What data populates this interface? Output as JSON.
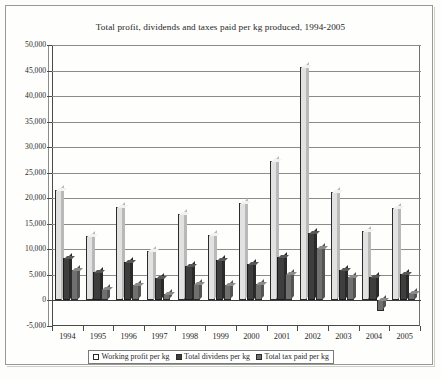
{
  "chart_data": {
    "type": "bar",
    "title": "Total profit, dividends and taxes paid per kg produced, 1994-2005",
    "xlabel": "",
    "ylabel": "",
    "ylim": [
      -5000,
      50000
    ],
    "ytick_step": 5000,
    "grid": true,
    "legend_position": "bottom",
    "categories": [
      "1994",
      "1995",
      "1996",
      "1997",
      "1998",
      "1999",
      "2000",
      "2001",
      "2002",
      "2003",
      "2004",
      "2005"
    ],
    "ytick_labels": [
      "50,000",
      "45,000",
      "40,000",
      "35,000",
      "30,000",
      "25,000",
      "20,000",
      "15,000",
      "10,000",
      "5,000",
      "0",
      "-5,000"
    ],
    "ytick_values": [
      50000,
      45000,
      40000,
      35000,
      30000,
      25000,
      20000,
      15000,
      10000,
      5000,
      0,
      -5000
    ],
    "series": [
      {
        "name": "Working profit per kg",
        "color": "#e2e2e2",
        "values": [
          21700,
          12600,
          18200,
          9700,
          16900,
          12800,
          19000,
          27300,
          45600,
          21200,
          13500,
          18100
        ]
      },
      {
        "name": "Total dividens per kg",
        "color": "#3e3e3e",
        "values": [
          8400,
          5600,
          7600,
          4400,
          6700,
          8000,
          7200,
          8600,
          13200,
          5900,
          4500,
          5200
        ]
      },
      {
        "name": "Total tax paid per kg",
        "color": "#707070",
        "values": [
          6000,
          2300,
          3000,
          1200,
          3300,
          3000,
          3200,
          5100,
          10300,
          4600,
          -2000,
          1500
        ]
      }
    ]
  }
}
